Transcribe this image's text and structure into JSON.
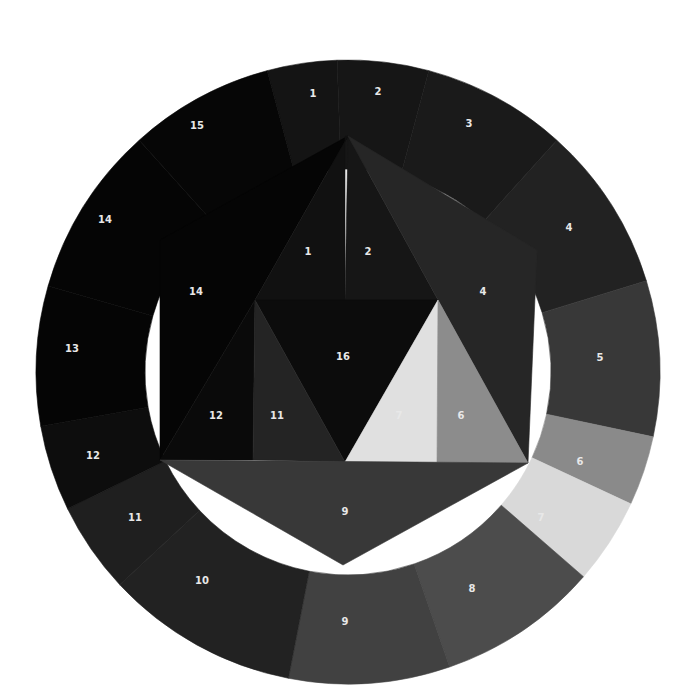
{
  "diagram": {
    "background": "#ffffff",
    "outer_ring": {
      "center": [
        348,
        372
      ],
      "outer_radius": 312,
      "inner_radius": 203,
      "segments": [
        {
          "label": "1",
          "start": 255,
          "end": 268,
          "color": "#141414",
          "label_pos": [
            313,
            94
          ]
        },
        {
          "label": "2",
          "start": 268,
          "end": 285,
          "color": "#161616",
          "label_pos": [
            378,
            92
          ]
        },
        {
          "label": "3",
          "start": 285,
          "end": 312,
          "color": "#1a1a1a",
          "label_pos": [
            469,
            124
          ]
        },
        {
          "label": "4",
          "start": 312,
          "end": 343,
          "color": "#222222",
          "label_pos": [
            569,
            228
          ]
        },
        {
          "label": "5",
          "start": 343,
          "end": 12,
          "color": "#383838",
          "label_pos": [
            600,
            358
          ]
        },
        {
          "label": "6",
          "start": 12,
          "end": 25,
          "color": "#8a8a8a",
          "label_pos": [
            580,
            462
          ]
        },
        {
          "label": "7",
          "start": 25,
          "end": 41,
          "color": "#d9d9d9",
          "label_pos": [
            541,
            518
          ]
        },
        {
          "label": "8",
          "start": 41,
          "end": 71,
          "color": "#4c4c4c",
          "label_pos": [
            472,
            589
          ]
        },
        {
          "label": "9",
          "start": 71,
          "end": 101,
          "color": "#414141",
          "label_pos": [
            345,
            622
          ]
        },
        {
          "label": "10",
          "start": 101,
          "end": 137,
          "color": "#222222",
          "label_pos": [
            202,
            581
          ]
        },
        {
          "label": "11",
          "start": 137,
          "end": 154,
          "color": "#1f1f1f",
          "label_pos": [
            135,
            518
          ]
        },
        {
          "label": "12",
          "start": 154,
          "end": 170,
          "color": "#0d0d0d",
          "label_pos": [
            93,
            456
          ]
        },
        {
          "label": "13",
          "start": 170,
          "end": 196,
          "color": "#050505",
          "label_pos": [
            72,
            349
          ]
        },
        {
          "label": "14",
          "start": 196,
          "end": 228,
          "color": "#050505",
          "label_pos": [
            105,
            220
          ]
        },
        {
          "label": "15",
          "start": 228,
          "end": 255,
          "color": "#060606",
          "label_pos": [
            197,
            126
          ]
        }
      ]
    },
    "inner_hexagon": {
      "polygons": [
        {
          "label": "14",
          "points": [
            [
              348,
              136
            ],
            [
              160,
              240
            ],
            [
              160,
              460
            ],
            [
              255,
              300
            ]
          ],
          "color": "#050505",
          "label_pos": [
            196,
            292
          ]
        },
        {
          "label": "1",
          "points": [
            [
              348,
              136
            ],
            [
              255,
              300
            ],
            [
              345,
              300
            ],
            [
              345,
              136
            ]
          ],
          "color": "#111111",
          "label_pos": [
            308,
            252
          ]
        },
        {
          "label": "2",
          "points": [
            [
              348,
              136
            ],
            [
              345,
              300
            ],
            [
              438,
              300
            ]
          ],
          "color": "#161616",
          "label_pos": [
            368,
            252
          ]
        },
        {
          "label": "4",
          "points": [
            [
              348,
              136
            ],
            [
              537,
              250
            ],
            [
              528,
              463
            ],
            [
              438,
              300
            ]
          ],
          "color": "#262626",
          "label_pos": [
            483,
            292
          ]
        },
        {
          "label": "16",
          "points": [
            [
              255,
              300
            ],
            [
              438,
              300
            ],
            [
              345,
              462
            ]
          ],
          "color": "#0c0c0c",
          "label_pos": [
            343,
            357
          ]
        },
        {
          "label": "12",
          "points": [
            [
              160,
              460
            ],
            [
              255,
              300
            ],
            [
              253,
              460
            ]
          ],
          "color": "#0a0a0a",
          "label_pos": [
            216,
            416
          ]
        },
        {
          "label": "11",
          "points": [
            [
              255,
              300
            ],
            [
              253,
              460
            ],
            [
              345,
              462
            ]
          ],
          "color": "#242424",
          "label_pos": [
            277,
            416
          ]
        },
        {
          "label": "7",
          "points": [
            [
              438,
              300
            ],
            [
              345,
              462
            ],
            [
              437,
              462
            ]
          ],
          "color": "#e0e0e0",
          "label_pos": [
            399,
            416
          ]
        },
        {
          "label": "6",
          "points": [
            [
              438,
              300
            ],
            [
              437,
              462
            ],
            [
              528,
              463
            ]
          ],
          "color": "#8c8c8c",
          "label_pos": [
            461,
            416
          ]
        },
        {
          "label": "9",
          "points": [
            [
              160,
              460
            ],
            [
              528,
              463
            ],
            [
              343,
              565
            ]
          ],
          "color": "#383838",
          "label_pos": [
            345,
            512
          ]
        }
      ]
    }
  }
}
